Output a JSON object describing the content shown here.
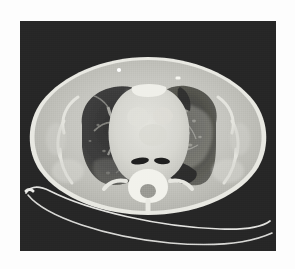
{
  "page": {
    "background_color": "#fdfdfd",
    "width": 295,
    "height": 269
  },
  "scan": {
    "modality_label": "CT",
    "view_label": "Axial chest CT",
    "background_color": "#262626",
    "frame": {
      "x": 20,
      "y": 21,
      "width": 256,
      "height": 230
    },
    "body": {
      "label": "thorax-cross-section",
      "soft_tissue_color": "#c9c9c4",
      "subcutaneous_fat_color": "#b4b4ae",
      "skin_line_color": "#e8e8e2"
    },
    "right_lung": {
      "label": "right-lung",
      "parenchyma_color": "#3c3c3c",
      "finding": "vascular markings with patchy opacity"
    },
    "left_lung": {
      "label": "left-lung",
      "parenchyma_color": "#3f3f3f",
      "finding": "ground-glass and reticular opacity"
    },
    "mediastinum": {
      "label": "mediastinum",
      "color": "#dcdcd6",
      "structures": [
        "heart",
        "great vessels",
        "sternum"
      ]
    },
    "airways": {
      "label": "main-bronchi",
      "color": "#1e1e1e",
      "count": 2
    },
    "spine": {
      "label": "vertebral-body",
      "bone_color": "#f2f2ec",
      "canal_color": "#9a9a94"
    },
    "skin_markers": [
      {
        "label": "skin-marker-anterior-left",
        "x": 119,
        "y": 70
      },
      {
        "label": "skin-marker-anterior-right",
        "x": 178,
        "y": 78
      }
    ],
    "table": {
      "label": "scanner-table",
      "line_color": "#ededea",
      "line_count": 2
    }
  }
}
